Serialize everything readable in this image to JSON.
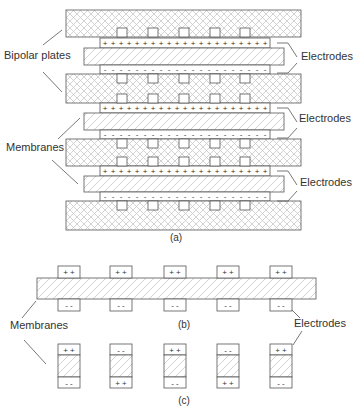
{
  "figure": {
    "panel_a": {
      "caption": "(a)",
      "labels": {
        "bipolar_plates": "Bipolar plates",
        "membranes": "Membranes",
        "electrodes": "Electrodes"
      },
      "layers": [
        {
          "type": "bipolar-plate",
          "y": 10,
          "h": 27
        },
        {
          "type": "electrode-plus",
          "y": 38,
          "h": 10,
          "sign": "+"
        },
        {
          "type": "membrane",
          "y": 48,
          "h": 17
        },
        {
          "type": "electrode-minus",
          "y": 65,
          "h": 9,
          "sign": "-"
        },
        {
          "type": "bipolar-plate",
          "y": 74,
          "h": 29
        },
        {
          "type": "electrode-plus",
          "y": 103,
          "h": 10,
          "sign": "+"
        },
        {
          "type": "membrane",
          "y": 113,
          "h": 17
        },
        {
          "type": "electrode-minus",
          "y": 130,
          "h": 9,
          "sign": "-"
        },
        {
          "type": "bipolar-plate",
          "y": 139,
          "h": 27
        },
        {
          "type": "electrode-plus",
          "y": 166,
          "h": 10,
          "sign": "+"
        },
        {
          "type": "membrane",
          "y": 176,
          "h": 16
        },
        {
          "type": "electrode-minus",
          "y": 192,
          "h": 9,
          "sign": "-"
        },
        {
          "type": "bipolar-plate",
          "y": 201,
          "h": 29
        }
      ],
      "tab_x": [
        117,
        148,
        179,
        210,
        240
      ],
      "electrode_labels_count": 3
    },
    "panel_b": {
      "caption": "(b)",
      "labels": {
        "membranes": "Membranes",
        "electrodes": "Electrodes"
      },
      "top_signs": [
        "+ +",
        "+ +",
        "+ +",
        "+ +",
        "+ +"
      ],
      "bottom_signs": [
        "- -",
        "- -",
        "- -",
        "- -",
        "- -"
      ],
      "tab_x": [
        58,
        110,
        164,
        217,
        270
      ]
    },
    "panel_c": {
      "caption": "(c)",
      "cells": [
        {
          "top": "+ +",
          "bottom": "- -"
        },
        {
          "top": "- -",
          "bottom": "+ +"
        },
        {
          "top": "+ +",
          "bottom": "- -"
        },
        {
          "top": "- -",
          "bottom": "+ +"
        },
        {
          "top": "+ +",
          "bottom": "- -"
        }
      ],
      "cell_x": [
        58,
        110,
        164,
        217,
        270
      ]
    },
    "colors": {
      "stroke": "#555555",
      "hatch": "#c8c8c8",
      "text": "#333333",
      "background": "#ffffff"
    }
  }
}
